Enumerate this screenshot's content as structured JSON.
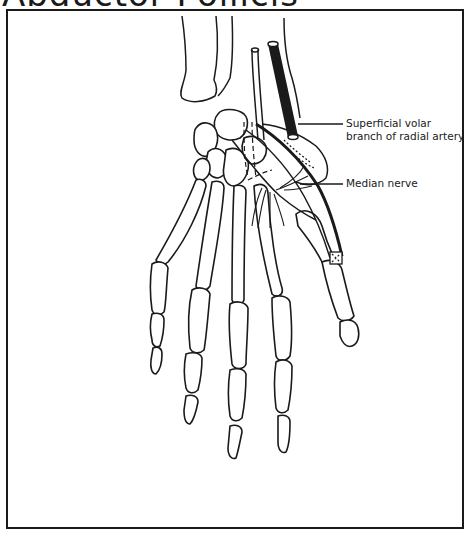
{
  "figure": {
    "title_partial": "Abductor Pollicis",
    "labels": {
      "artery_line1": "Superficial volar",
      "artery_line2": "branch of radial artery",
      "nerve": "Median nerve"
    },
    "structures": [
      "radius",
      "ulna",
      "carpal-bones",
      "metacarpals",
      "phalanges",
      "superficial-volar-branch-of-radial-artery",
      "median-nerve",
      "thumb"
    ],
    "colors": {
      "ink": "#1a1a1a",
      "background": "#ffffff"
    }
  }
}
